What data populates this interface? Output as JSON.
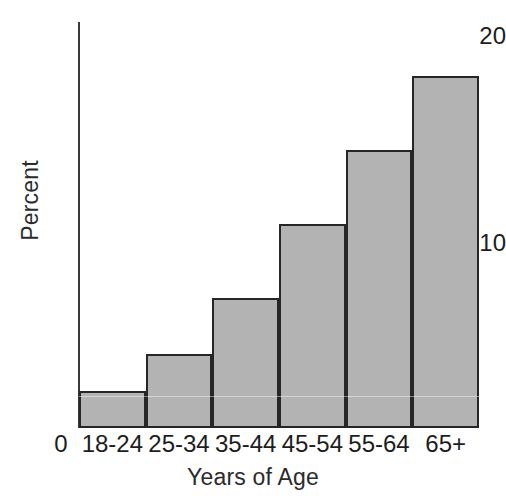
{
  "chart_data": {
    "type": "bar",
    "title": "",
    "subtitle": "",
    "xlabel": "Years of Age",
    "ylabel": "Percent",
    "categories": [
      "18-24",
      "25-34",
      "35-44",
      "45-54",
      "55-64",
      "65+"
    ],
    "values": [
      2,
      4,
      7,
      11,
      15,
      19
    ],
    "series": [
      {
        "name": "Percent",
        "values": [
          2,
          4,
          7,
          11,
          15,
          19
        ]
      }
    ],
    "ylim": [
      0,
      20
    ],
    "yticks": [
      0,
      10,
      20
    ],
    "ytick_labels": [
      "0",
      "10",
      "20"
    ],
    "xtick_labels": [
      "18-24",
      "25-34",
      "35-44",
      "45-54",
      "55-64",
      "65+"
    ],
    "grid": false,
    "legend": false,
    "legend_position": "none",
    "bar_fill_color": "#b3b3b3",
    "bar_edge_color": "#262626",
    "background_color": "#ffffff",
    "axis_color": "#3a3a3a",
    "text_color": "#1d1d1d"
  },
  "axes": {
    "y_title": "Percent",
    "x_title": "Years of Age",
    "y_tick_top": "20",
    "y_tick_mid": "10",
    "y_tick_origin": "0"
  },
  "bars": [
    {
      "label": "18-24",
      "value": 2
    },
    {
      "label": "25-34",
      "value": 4
    },
    {
      "label": "35-44",
      "value": 7
    },
    {
      "label": "45-54",
      "value": 11
    },
    {
      "label": "55-64",
      "value": 15
    },
    {
      "label": "65+",
      "value": 19
    }
  ]
}
